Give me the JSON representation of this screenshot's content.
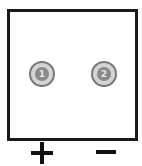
{
  "diagram": {
    "type": "battery-terminal-diagram",
    "terminals": [
      {
        "id": "1",
        "label": "1",
        "polarity": "+"
      },
      {
        "id": "2",
        "label": "2",
        "polarity": "-"
      }
    ],
    "polarity_labels": {
      "positive": "+",
      "negative": "−"
    },
    "colors": {
      "outline": "#1a1a1a",
      "terminal_ring": "#d4d4d4",
      "terminal_center": "#8a8a8a"
    }
  }
}
